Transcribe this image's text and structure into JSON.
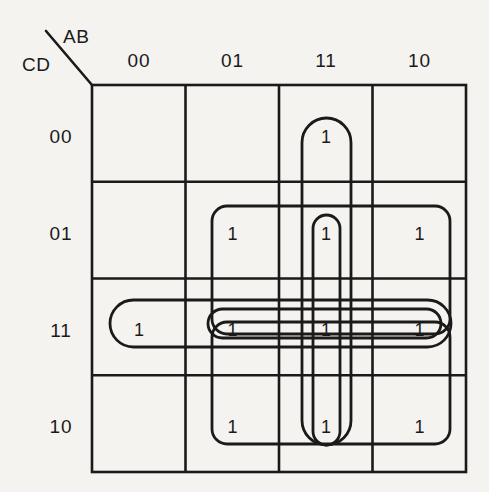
{
  "diagram": {
    "type": "karnaugh-map",
    "variables": {
      "columns_label": "AB",
      "rows_label": "CD"
    },
    "column_headers": [
      "00",
      "01",
      "11",
      "10"
    ],
    "row_headers": [
      "00",
      "01",
      "11",
      "10"
    ],
    "cells": [
      {
        "row": "00",
        "values": [
          "",
          "",
          "1",
          ""
        ]
      },
      {
        "row": "01",
        "values": [
          "",
          "1",
          "1",
          "1"
        ]
      },
      {
        "row": "11",
        "values": [
          "1",
          "1",
          "1",
          "1"
        ]
      },
      {
        "row": "10",
        "values": [
          "",
          "1",
          "1",
          "1"
        ]
      }
    ],
    "cell_text": {
      "r0c0": "",
      "r0c1": "",
      "r0c2": "1",
      "r0c3": "",
      "r1c0": "",
      "r1c1": "1",
      "r1c2": "1",
      "r1c3": "1",
      "r2c0": "1",
      "r2c1": "1",
      "r2c2": "1",
      "r2c3": "1",
      "r3c0": "",
      "r3c1": "1",
      "r3c2": "1",
      "r3c3": "1"
    },
    "groups": [
      {
        "name": "vertical-col11-all-rows",
        "orientation": "vertical",
        "columns": [
          "11"
        ],
        "rows": [
          "00",
          "01",
          "11",
          "10"
        ]
      },
      {
        "name": "vertical-col11-rows01-10",
        "orientation": "vertical",
        "columns": [
          "11"
        ],
        "rows": [
          "01",
          "11",
          "10"
        ]
      },
      {
        "name": "horizontal-row11-all-columns",
        "orientation": "horizontal",
        "columns": [
          "00",
          "01",
          "11",
          "10"
        ],
        "rows": [
          "11"
        ]
      },
      {
        "name": "horizontal-row11-cols01-10",
        "orientation": "horizontal",
        "columns": [
          "01",
          "11",
          "10"
        ],
        "rows": [
          "11"
        ]
      },
      {
        "name": "horizontal-row01-cols01-10",
        "orientation": "horizontal",
        "columns": [
          "01",
          "11",
          "10"
        ],
        "rows": [
          "01"
        ]
      },
      {
        "name": "horizontal-row10-cols01-10",
        "orientation": "horizontal",
        "columns": [
          "01",
          "11",
          "10"
        ],
        "rows": [
          "10"
        ]
      }
    ],
    "colors": {
      "background": "#f4f3f0",
      "grid_line": "#1a1a1a",
      "group_outline": "#1a1a1a",
      "text": "#1a1a1a"
    }
  }
}
